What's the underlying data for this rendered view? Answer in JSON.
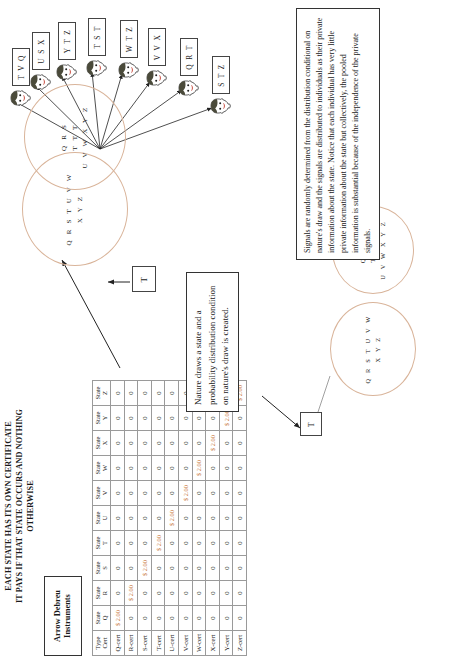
{
  "figure": {
    "orientation": "rotated-90-ccw",
    "accent_color": "#c8763c",
    "ellipse_color": "#d9b49a"
  },
  "table": {
    "title_lines": [
      "EACH STATE HAS ITS OWN CERTIFICATE",
      "IT PAYS IF THAT STATE OCCURS AND NOTHING",
      "OTHERWISE"
    ],
    "label_box": "Arrow Debreu Instruments",
    "header": [
      {
        "top": "Type",
        "bottom": "Cert"
      },
      {
        "top": "State",
        "bottom": "Q"
      },
      {
        "top": "State",
        "bottom": "R"
      },
      {
        "top": "State",
        "bottom": "S"
      },
      {
        "top": "State",
        "bottom": "T"
      },
      {
        "top": "State",
        "bottom": "U"
      },
      {
        "top": "State",
        "bottom": "V"
      },
      {
        "top": "State",
        "bottom": "W"
      },
      {
        "top": "State",
        "bottom": "X"
      },
      {
        "top": "State",
        "bottom": "Y"
      },
      {
        "top": "State",
        "bottom": "Z"
      }
    ],
    "pay_value": "$ 2.00",
    "zero_value": "0",
    "rows": [
      {
        "label": "Q-cert",
        "cells": [
          "$ 2.00",
          "0",
          "0",
          "0",
          "0",
          "0",
          "0",
          "0",
          "0",
          "0"
        ]
      },
      {
        "label": "R-cert",
        "cells": [
          "0",
          "$ 2.00",
          "0",
          "0",
          "0",
          "0",
          "0",
          "0",
          "0",
          "0"
        ]
      },
      {
        "label": "S-cert",
        "cells": [
          "0",
          "0",
          "$ 2.00",
          "0",
          "0",
          "0",
          "0",
          "0",
          "0",
          "0"
        ]
      },
      {
        "label": "T-cert",
        "cells": [
          "0",
          "0",
          "0",
          "$ 2.00",
          "0",
          "0",
          "0",
          "0",
          "0",
          "0"
        ]
      },
      {
        "label": "U-cert",
        "cells": [
          "0",
          "0",
          "0",
          "0",
          "$ 2.00",
          "0",
          "0",
          "0",
          "0",
          "0"
        ]
      },
      {
        "label": "V-cert",
        "cells": [
          "0",
          "0",
          "0",
          "0",
          "0",
          "$ 2.00",
          "0",
          "0",
          "0",
          "0"
        ]
      },
      {
        "label": "W-cert",
        "cells": [
          "0",
          "0",
          "0",
          "0",
          "0",
          "0",
          "$ 2.00",
          "0",
          "0",
          "0"
        ]
      },
      {
        "label": "X-cert",
        "cells": [
          "0",
          "0",
          "0",
          "0",
          "0",
          "0",
          "0",
          "$ 2.00",
          "0",
          "0"
        ]
      },
      {
        "label": "Y-cert",
        "cells": [
          "0",
          "0",
          "0",
          "0",
          "0",
          "0",
          "0",
          "0",
          "$ 2.00",
          "0"
        ]
      },
      {
        "label": "Z-cert",
        "cells": [
          "0",
          "0",
          "0",
          "0",
          "0",
          "0",
          "0",
          "0",
          "0",
          "$ 2.00"
        ]
      }
    ]
  },
  "notes": {
    "nature": "Nature draws a state and a probability distribution condition on nature's draw is created.",
    "signals": "Signals are randomly determined from the distribution conditional on nature's draw and the signals are distributed to individuals as their private information about the state. Notice that each individual has very little private information about the state but collectively, the pooled information is substantial because of the independence of the private signals."
  },
  "small_diagram": {
    "state_box": "T",
    "prior_ellipse": {
      "line1": "Q R S T U V W",
      "line2": "X Y Z"
    },
    "posterior_ellipse": {
      "line1": "Q R S",
      "line2": "T T T",
      "line3": "U V W X Y Z"
    }
  },
  "main_diagram": {
    "state_box": "T",
    "prior_ellipse": {
      "line1": "Q R S T U V W",
      "line2": "X Y Z"
    },
    "posterior_ellipse": {
      "line1": "Q R S",
      "line2": "T T T",
      "line3": "U V W X Y Z"
    },
    "signal_boxes": [
      {
        "id": "signal-1",
        "text": "S T Z"
      },
      {
        "id": "signal-2",
        "text": "Q R T"
      },
      {
        "id": "signal-3",
        "text": "V V X"
      },
      {
        "id": "signal-4",
        "text": "W T Z"
      },
      {
        "id": "signal-5",
        "text": "T S T"
      },
      {
        "id": "signal-6",
        "text": "Y T Z"
      },
      {
        "id": "signal-7",
        "text": "U S X"
      },
      {
        "id": "signal-8",
        "text": "T V Q"
      }
    ]
  }
}
